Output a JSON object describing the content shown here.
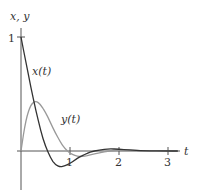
{
  "chart_data": {
    "type": "line",
    "title": "",
    "xlabel": "t",
    "ylabel": "x, y",
    "xlim": [
      0,
      3.3
    ],
    "ylim": [
      -0.35,
      1.1
    ],
    "x_ticks": [
      "1",
      "2",
      "3"
    ],
    "y_ticks": [
      "1"
    ],
    "grid": false,
    "series": [
      {
        "name": "x(t)",
        "color": "#333333",
        "points": [
          [
            0,
            1.0
          ],
          [
            0.1,
            0.78
          ],
          [
            0.2,
            0.56
          ],
          [
            0.3,
            0.36
          ],
          [
            0.4,
            0.18
          ],
          [
            0.5,
            0.04
          ],
          [
            0.6,
            -0.06
          ],
          [
            0.7,
            -0.12
          ],
          [
            0.8,
            -0.14
          ],
          [
            0.9,
            -0.13
          ],
          [
            1.0,
            -0.11
          ],
          [
            1.1,
            -0.08
          ],
          [
            1.2,
            -0.05
          ],
          [
            1.3,
            -0.03
          ],
          [
            1.4,
            -0.01
          ],
          [
            1.6,
            0.01
          ],
          [
            1.8,
            0.02
          ],
          [
            2.0,
            0.015
          ],
          [
            2.2,
            0.008
          ],
          [
            2.5,
            0.002
          ],
          [
            3.0,
            0.0
          ],
          [
            3.2,
            0.0
          ]
        ]
      },
      {
        "name": "y(t)",
        "color": "#999999",
        "points": [
          [
            0,
            0.0
          ],
          [
            0.1,
            0.28
          ],
          [
            0.2,
            0.41
          ],
          [
            0.3,
            0.44
          ],
          [
            0.4,
            0.41
          ],
          [
            0.5,
            0.34
          ],
          [
            0.6,
            0.25
          ],
          [
            0.7,
            0.16
          ],
          [
            0.8,
            0.08
          ],
          [
            0.9,
            0.02
          ],
          [
            1.0,
            -0.02
          ],
          [
            1.1,
            -0.04
          ],
          [
            1.2,
            -0.05
          ],
          [
            1.3,
            -0.045
          ],
          [
            1.4,
            -0.035
          ],
          [
            1.6,
            -0.015
          ],
          [
            1.8,
            0.0
          ],
          [
            2.0,
            0.008
          ],
          [
            2.2,
            0.006
          ],
          [
            2.5,
            0.002
          ],
          [
            3.0,
            0.0
          ],
          [
            3.2,
            0.0
          ]
        ]
      }
    ],
    "annotations": [
      {
        "text": "x(t)",
        "at": [
          0.17,
          0.55
        ]
      },
      {
        "text": "y(t)",
        "at": [
          1.0,
          0.27
        ]
      }
    ]
  },
  "labels": {
    "y_axis": "x, y",
    "x_axis": "t",
    "y_tick_1": "1",
    "x_tick_1": "1",
    "x_tick_2": "2",
    "x_tick_3": "3",
    "series_x": "x(t)",
    "series_y": "y(t)"
  }
}
